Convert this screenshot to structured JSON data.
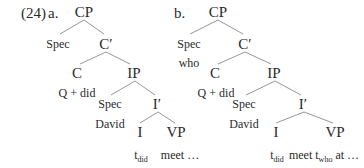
{
  "example_number": "(24)",
  "trees": [
    {
      "label": "a.",
      "nodes": {
        "cp": "CP",
        "spec": "Spec",
        "cbar": "C′",
        "c": "C",
        "ip": "IP",
        "c_content": "Q + did",
        "ip_spec": "Spec",
        "ibar": "I′",
        "ip_spec_content": "David",
        "i": "I",
        "vp": "VP",
        "i_trace": "t",
        "i_trace_sub": "did",
        "vp_content": "meet …"
      }
    },
    {
      "label": "b.",
      "nodes": {
        "cp": "CP",
        "spec": "Spec",
        "spec_content": "who",
        "cbar": "C′",
        "c": "C",
        "ip": "IP",
        "c_content": "Q + did",
        "ip_spec": "Spec",
        "ibar": "I′",
        "ip_spec_content": "David",
        "i": "I",
        "vp": "VP",
        "i_trace": "t",
        "i_trace_sub": "did",
        "vp_content_pre": "meet t",
        "vp_content_sub": "who",
        "vp_content_post": " at …"
      }
    }
  ],
  "colors": {
    "line": "#8a8a8a",
    "text": "#2a2a2a"
  }
}
